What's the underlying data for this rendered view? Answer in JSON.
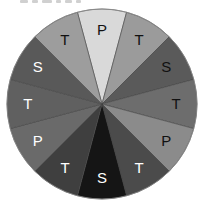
{
  "chart_data": {
    "type": "pie",
    "title": "",
    "center": [
      102,
      104
    ],
    "radius": 95,
    "start_angle_deg": -15,
    "direction": "clockwise",
    "slices": [
      {
        "label": "P",
        "value": 1,
        "color": "#d9d9d9",
        "text_color": "#111111"
      },
      {
        "label": "T",
        "value": 1,
        "color": "#9b9b9b",
        "text_color": "#111111"
      },
      {
        "label": "S",
        "value": 1,
        "color": "#5a5a5a",
        "text_color": "#111111"
      },
      {
        "label": "T",
        "value": 1,
        "color": "#6d6d6d",
        "text_color": "#111111"
      },
      {
        "label": "P",
        "value": 1,
        "color": "#8b8b8b",
        "text_color": "#111111"
      },
      {
        "label": "T",
        "value": 1,
        "color": "#4b4b4b",
        "text_color": "#ffffff"
      },
      {
        "label": "S",
        "value": 1,
        "color": "#151515",
        "text_color": "#ffffff"
      },
      {
        "label": "T",
        "value": 1,
        "color": "#3f3f3f",
        "text_color": "#ffffff"
      },
      {
        "label": "P",
        "value": 1,
        "color": "#6a6a6a",
        "text_color": "#ffffff"
      },
      {
        "label": "T",
        "value": 1,
        "color": "#606060",
        "text_color": "#ffffff"
      },
      {
        "label": "S",
        "value": 1,
        "color": "#595959",
        "text_color": "#ffffff"
      },
      {
        "label": "T",
        "value": 1,
        "color": "#9d9d9d",
        "text_color": "#111111"
      }
    ],
    "categories": [
      "P",
      "T",
      "S",
      "T",
      "P",
      "T",
      "S",
      "T",
      "P",
      "T",
      "S",
      "T"
    ],
    "values": [
      1,
      1,
      1,
      1,
      1,
      1,
      1,
      1,
      1,
      1,
      1,
      1
    ],
    "legend": "none",
    "grid": false
  },
  "style": {
    "slice_border": "#444444",
    "outline": "#888888"
  }
}
